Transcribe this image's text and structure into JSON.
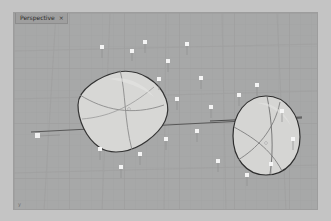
{
  "app": {
    "name": "3D Modeling Viewport",
    "background_color": "#a7a8a8",
    "frame_color": "#c4c4c4"
  },
  "viewport": {
    "tab": {
      "label": "Perspective",
      "close_glyph": "×",
      "active": true
    },
    "axis_corner_label": "y",
    "grid": {
      "visible": true,
      "minor_color": "#a0a1a1",
      "major_color": "#9a9b9b",
      "horizon_color": "#6a6a6a",
      "minor_spacing_px": 11,
      "major_spacing_px": 55
    }
  },
  "scene": {
    "objects": [
      {
        "name": "surface-blob-left",
        "shape": "rounded-triangle",
        "fill": "#d6d6d4",
        "outline": "#3a3a3a",
        "isoparm_color": "#8a8a8a",
        "center": [
          116,
          105
        ],
        "selected": true
      },
      {
        "name": "surface-egg-right",
        "shape": "egg-oval",
        "fill": "#d4d4d2",
        "outline": "#2f2f2f",
        "isoparm_color": "#7d7d7d",
        "center": [
          263,
          126
        ],
        "selected": true
      }
    ],
    "control_points": {
      "name": "control-point-markers",
      "count": 22,
      "marker_color": "#f2f2f2",
      "stem_color": "#8f8f8f",
      "positions": [
        [
          131,
          52
        ],
        [
          144,
          43
        ],
        [
          167,
          62
        ],
        [
          186,
          45
        ],
        [
          200,
          79
        ],
        [
          158,
          80
        ],
        [
          124,
          70
        ],
        [
          101,
          60
        ],
        [
          90,
          48
        ],
        [
          176,
          100
        ],
        [
          210,
          108
        ],
        [
          196,
          132
        ],
        [
          165,
          140
        ],
        [
          139,
          155
        ],
        [
          120,
          168
        ],
        [
          99,
          150
        ],
        [
          238,
          96
        ],
        [
          256,
          86
        ],
        [
          281,
          112
        ],
        [
          292,
          140
        ],
        [
          270,
          165
        ],
        [
          246,
          176
        ]
      ]
    },
    "construction_line": {
      "name": "horizon-construction-line",
      "color": "#555555",
      "from": [
        30,
        131
      ],
      "to": [
        300,
        117
      ]
    }
  }
}
